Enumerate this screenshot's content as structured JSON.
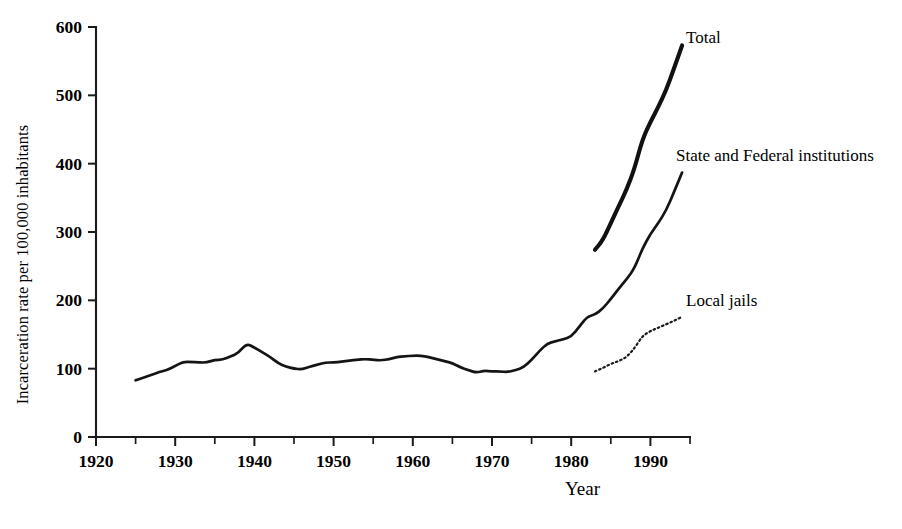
{
  "chart_data": {
    "type": "line",
    "title": "",
    "xlabel": "Year",
    "ylabel": "Incarceration rate per 100,000 inhabitants",
    "xlim": [
      1920,
      1995
    ],
    "ylim": [
      0,
      600
    ],
    "grid": false,
    "legend_position": "inline-right-annotations",
    "x_ticks": [
      1920,
      1930,
      1940,
      1950,
      1960,
      1970,
      1980,
      1990
    ],
    "x_minor_ticks": [
      1925,
      1935,
      1945,
      1955,
      1965,
      1975,
      1985,
      1995
    ],
    "y_ticks": [
      0,
      100,
      200,
      300,
      400,
      500,
      600
    ],
    "series": [
      {
        "name": "State and Federal institutions",
        "style": "solid",
        "x": [
          1925,
          1926,
          1927,
          1928,
          1929,
          1930,
          1931,
          1932,
          1933,
          1934,
          1935,
          1936,
          1937,
          1938,
          1939,
          1940,
          1941,
          1942,
          1943,
          1944,
          1945,
          1946,
          1947,
          1948,
          1949,
          1950,
          1951,
          1952,
          1953,
          1954,
          1955,
          1956,
          1957,
          1958,
          1959,
          1960,
          1961,
          1962,
          1963,
          1964,
          1965,
          1966,
          1967,
          1968,
          1969,
          1970,
          1971,
          1972,
          1973,
          1974,
          1975,
          1976,
          1977,
          1978,
          1979,
          1980,
          1981,
          1982,
          1983,
          1984,
          1985,
          1986,
          1987,
          1988,
          1989,
          1990,
          1991,
          1992,
          1993,
          1994
        ],
        "values": [
          83,
          87,
          91,
          95,
          98,
          104,
          110,
          110,
          109,
          109,
          113,
          113,
          118,
          123,
          137,
          131,
          124,
          117,
          108,
          103,
          100,
          99,
          103,
          106,
          109,
          109,
          110,
          112,
          113,
          114,
          113,
          112,
          114,
          117,
          118,
          119,
          119,
          117,
          114,
          111,
          108,
          102,
          98,
          94,
          97,
          96,
          96,
          95,
          98,
          102,
          113,
          126,
          137,
          140,
          143,
          147,
          161,
          176,
          179,
          188,
          202,
          217,
          231,
          247,
          276,
          297,
          313,
          332,
          359,
          387
        ]
      },
      {
        "name": "Total",
        "style": "solid-thick",
        "x": [
          1983,
          1984,
          1985,
          1986,
          1987,
          1988,
          1989,
          1990,
          1991,
          1992,
          1993,
          1994
        ],
        "values": [
          274,
          288,
          313,
          338,
          362,
          393,
          436,
          461,
          483,
          508,
          540,
          573
        ]
      },
      {
        "name": "Local jails",
        "style": "dotted",
        "x": [
          1983,
          1984,
          1985,
          1986,
          1987,
          1988,
          1989,
          1990,
          1991,
          1992,
          1993,
          1994
        ],
        "values": [
          96,
          101,
          107,
          111,
          117,
          130,
          148,
          155,
          160,
          165,
          170,
          176
        ]
      }
    ],
    "annotations": [
      {
        "label": "Total",
        "at_x": 1994,
        "at_y": 573
      },
      {
        "label": "State and Federal institutions",
        "at_x": 1994,
        "at_y": 387
      },
      {
        "label": "Local jails",
        "at_x": 1994,
        "at_y": 176
      }
    ]
  },
  "axes": {
    "y_title": "Incarceration rate per 100,000 inhabitants",
    "x_title": "Year",
    "y_tick_labels": [
      "600",
      "500",
      "400",
      "300",
      "200",
      "100",
      "0"
    ],
    "x_tick_labels": [
      "1920",
      "1930",
      "1940",
      "1950",
      "1960",
      "1970",
      "1980",
      "1990"
    ]
  },
  "labels": {
    "total": "Total",
    "state_federal": "State and Federal institutions",
    "local_jails": "Local jails"
  },
  "colors": {
    "ink": "#111111",
    "background": "#ffffff"
  }
}
